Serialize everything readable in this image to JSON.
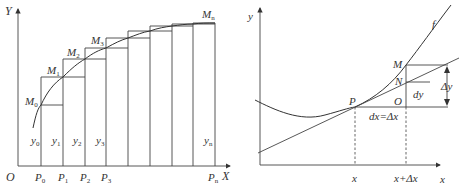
{
  "left_figure": {
    "title": "Riemann rectangles under increasing curve",
    "y_axis_label": "Y",
    "x_axis_label": "X",
    "origin_label": "O",
    "points_M": [
      {
        "name": "M",
        "sub": "0"
      },
      {
        "name": "M",
        "sub": "1"
      },
      {
        "name": "M",
        "sub": "2"
      },
      {
        "name": "M",
        "sub": "3"
      },
      {
        "name": "M",
        "sub": "n"
      }
    ],
    "points_P": [
      {
        "name": "P",
        "sub": "0"
      },
      {
        "name": "P",
        "sub": "1"
      },
      {
        "name": "P",
        "sub": "2"
      },
      {
        "name": "P",
        "sub": "3"
      },
      {
        "name": "P",
        "sub": "n"
      }
    ],
    "heights_y": [
      {
        "name": "y",
        "sub": "0"
      },
      {
        "name": "y",
        "sub": "1"
      },
      {
        "name": "y",
        "sub": "2"
      },
      {
        "name": "y",
        "sub": "3"
      },
      {
        "name": "y",
        "sub": "n"
      }
    ],
    "bar_edges_x": [
      41,
      63,
      85,
      106,
      128,
      150,
      172,
      193,
      215
    ],
    "curve_y_at_edges": [
      105,
      77,
      59,
      48,
      38,
      31,
      26,
      24,
      23
    ]
  },
  "right_figure": {
    "title": "Differential dy vs increment Δy",
    "y_axis_label": "y",
    "x_axis_label": "x",
    "curve_label": "f",
    "point_P": "P",
    "point_M": "M",
    "point_N": "N",
    "point_O": "O",
    "dy_label": "dy",
    "dx_label": "dx=Δx",
    "delta_y_label": "Δy",
    "tick_x": "x",
    "tick_x_plus_dx": "x+Δx"
  }
}
